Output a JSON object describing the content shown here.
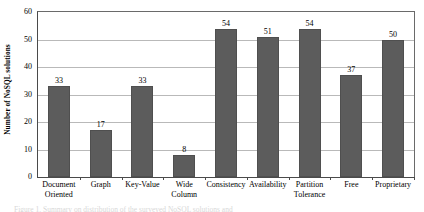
{
  "chart_data": {
    "type": "bar",
    "title": "",
    "xlabel": "",
    "ylabel": "Number of NoSQL solutions",
    "categories": [
      "Document Oriented",
      "Graph",
      "Key-Value",
      "Wide Column",
      "Consistency",
      "Availability",
      "Partition Tolerance",
      "Free",
      "Proprietary"
    ],
    "category_lines": [
      [
        "Document",
        "Oriented"
      ],
      [
        "Graph"
      ],
      [
        "Key-Value"
      ],
      [
        "Wide",
        "Column"
      ],
      [
        "Consistency"
      ],
      [
        "Availability"
      ],
      [
        "Partition",
        "Tolerance"
      ],
      [
        "Free"
      ],
      [
        "Proprietary"
      ]
    ],
    "values": [
      33,
      17,
      33,
      8,
      54,
      51,
      54,
      37,
      50
    ],
    "ylim": [
      0,
      60
    ],
    "ytick_labels": [
      "0",
      "10",
      "20",
      "30",
      "40",
      "50",
      "60"
    ],
    "ytick_values": [
      0,
      10,
      20,
      30,
      40,
      50,
      60
    ],
    "grid": true,
    "legend": "none",
    "bar_color": "#5c5c5c",
    "grid_color": "#b9b9b9",
    "axis_color": "#4a4a4a",
    "background_color": "#ffffff"
  },
  "caption": {
    "text": "Figure 1. Summary on distribution of the surveyed NoSQL solutions and"
  }
}
